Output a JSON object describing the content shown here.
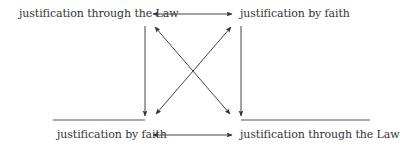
{
  "diagram": {
    "top_left": "justification through the Law",
    "top_right": "justification by faith",
    "bottom_left": "justification by faith",
    "bottom_right": "justification through the Law",
    "line_color": "#444444",
    "text_color": "#333333"
  }
}
